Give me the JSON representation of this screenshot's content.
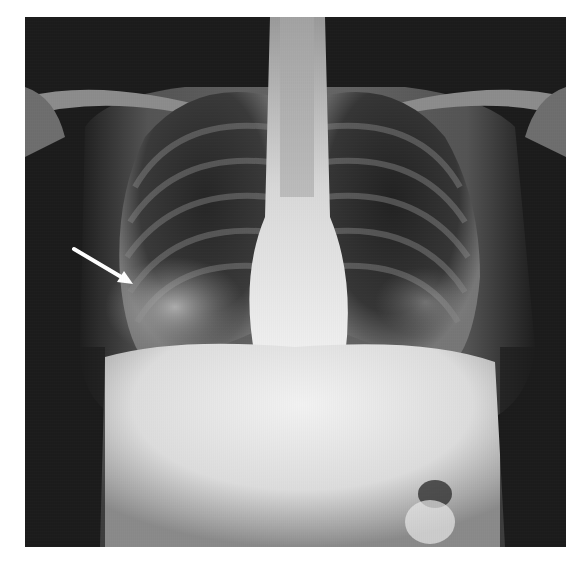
{
  "image": {
    "kind": "chest radiograph",
    "view": "posteroanterior",
    "frame": {
      "x": 25,
      "y": 17,
      "width": 541,
      "height": 530
    },
    "background_color": "#ffffff",
    "film_base_color": "#1c1c1c"
  },
  "annotation": {
    "type": "arrow",
    "color": "#ffffff",
    "start": {
      "x": 74,
      "y": 249
    },
    "end": {
      "x": 130,
      "y": 283
    },
    "points_to": "right lower zone opacity"
  },
  "regions": [
    "right-lung",
    "left-lung",
    "mediastinum",
    "spine",
    "clavicles",
    "diaphragm",
    "abdomen",
    "gastric-bubble"
  ]
}
